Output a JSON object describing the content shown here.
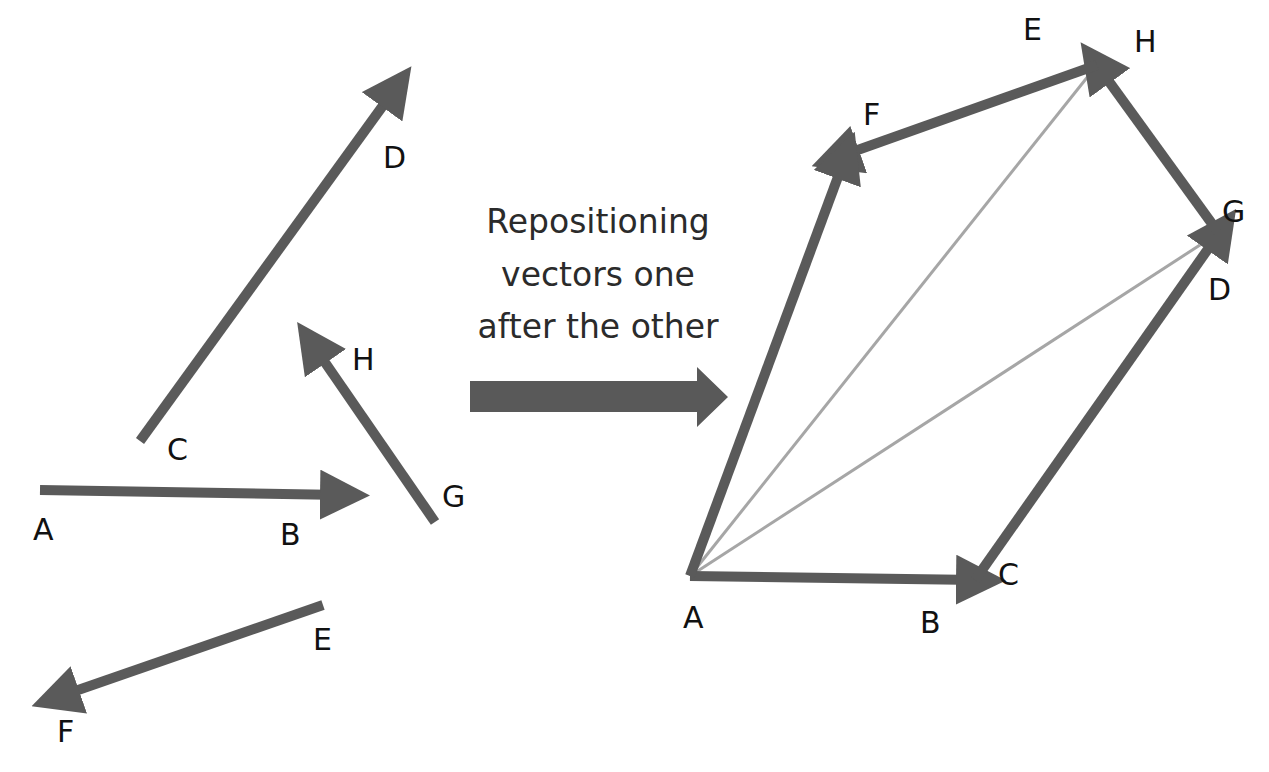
{
  "colors": {
    "vector": "#5a5a5a",
    "resultant": "#a6a6a6",
    "big_arrow": "#595959",
    "text": "#111111"
  },
  "caption": {
    "line1": "Repositioning",
    "line2": "vectors one",
    "line3": "after the other"
  },
  "left_panel": {
    "title": "Separate vectors",
    "vectors": [
      {
        "name": "AB",
        "from": [
          40,
          490
        ],
        "to": [
          342,
          495
        ],
        "tail_label": "A",
        "head_label": "B"
      },
      {
        "name": "CD",
        "from": [
          140,
          441
        ],
        "to": [
          395,
          89
        ],
        "tail_label": "C",
        "head_label": "D"
      },
      {
        "name": "GH",
        "from": [
          435,
          522
        ],
        "to": [
          313,
          345
        ],
        "tail_label": "G",
        "head_label": "H"
      },
      {
        "name": "EF",
        "from": [
          323,
          605
        ],
        "to": [
          58,
          697
        ],
        "tail_label": "E",
        "head_label": "F"
      }
    ],
    "labels": [
      {
        "text": "A",
        "x": 33,
        "y": 540
      },
      {
        "text": "B",
        "x": 280,
        "y": 545
      },
      {
        "text": "C",
        "x": 167,
        "y": 460
      },
      {
        "text": "D",
        "x": 383,
        "y": 168
      },
      {
        "text": "H",
        "x": 352,
        "y": 370
      },
      {
        "text": "G",
        "x": 442,
        "y": 507
      },
      {
        "text": "E",
        "x": 313,
        "y": 650
      },
      {
        "text": "F",
        "x": 57,
        "y": 742
      }
    ]
  },
  "transition_arrow": {
    "label": "repositioning-arrow",
    "from": [
      470,
      397
    ],
    "to": [
      730,
      397
    ]
  },
  "right_panel": {
    "title": "Head-to-tail arrangement",
    "vectors": [
      {
        "name": "AB",
        "from": [
          690,
          576
        ],
        "to": [
          978,
          580
        ],
        "tail_label": "A",
        "head_label": "B"
      },
      {
        "name": "CD",
        "from": [
          975,
          580
        ],
        "to": [
          1220,
          232
        ],
        "tail_label": "C",
        "head_label": "D"
      },
      {
        "name": "GH",
        "from": [
          1218,
          232
        ],
        "to": [
          1097,
          65
        ],
        "tail_label": "G",
        "head_label": "H"
      },
      {
        "name": "EF",
        "from": [
          1097,
          65
        ],
        "to": [
          838,
          157
        ],
        "tail_label": "E",
        "head_label": "F"
      },
      {
        "name": "AF",
        "from": [
          690,
          576
        ],
        "to": [
          845,
          158
        ],
        "tail_label": "A",
        "head_label": "F"
      }
    ],
    "resultants": [
      {
        "name": "AE",
        "from": [
          690,
          576
        ],
        "to": [
          1097,
          65
        ]
      },
      {
        "name": "AG",
        "from": [
          690,
          576
        ],
        "to": [
          1220,
          232
        ]
      }
    ],
    "labels": [
      {
        "text": "A",
        "x": 683,
        "y": 628
      },
      {
        "text": "B",
        "x": 920,
        "y": 633
      },
      {
        "text": "C",
        "x": 998,
        "y": 585
      },
      {
        "text": "D",
        "x": 1208,
        "y": 300
      },
      {
        "text": "G",
        "x": 1222,
        "y": 222
      },
      {
        "text": "E",
        "x": 1023,
        "y": 40
      },
      {
        "text": "H",
        "x": 1134,
        "y": 52
      },
      {
        "text": "F",
        "x": 863,
        "y": 125
      }
    ]
  }
}
